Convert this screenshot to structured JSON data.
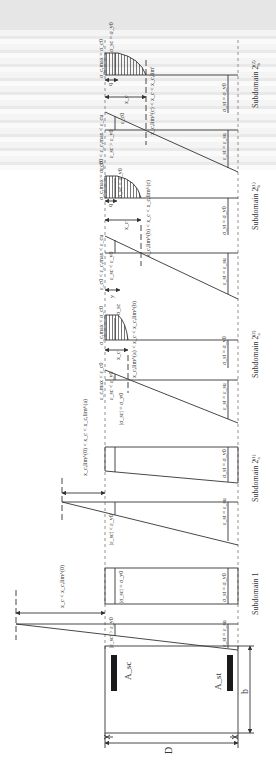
{
  "figure": {
    "orientation": "rotated-90-ccw",
    "subdomains": [
      {
        "id": "sub1",
        "title": "Subdomain 1",
        "strain_condition": "|ε_sc| > ε_y0",
        "strain_tension": "ε_st = ε_su",
        "stress_compression": "|σ_sc| = σ_y0",
        "stress_tension": "σ_st = σ_y0",
        "neutral_axis": "x_c < x_c,lim^(0)"
      },
      {
        "id": "sub2a1",
        "title": "Subdomain 2a(1)",
        "title_main": "Subdomain 2",
        "title_sub": "a",
        "title_sup": "(1)",
        "strain_condition": "|ε_sc| < ε_y0",
        "strain_tension": "ε_st = ε_su",
        "stress_compression": "|σ_sc| = σ_y0",
        "stress_tension": "σ_st = σ_y0",
        "neutral_axis": "x_c,lim^(0) < x_c < x_c,lim^(a)"
      },
      {
        "id": "sub2a2",
        "title": "Subdomain 2a(2)",
        "title_main": "Subdomain 2",
        "title_sub": "a",
        "title_sup": "(2)",
        "strain_top": "ε_c,max < ε_c0",
        "strain_condition": "ε_sc < ε_y0",
        "strain_tension": "ε_st = ε_su",
        "stress_top": "σ_c,max < σ_c0",
        "stress_compression": "σ_sc",
        "stress_tension": "σ_st = σ_y0",
        "depth": "x_c",
        "neutral_axis": "x_c,lim^(a) < x_c < x_c,lim^(b)"
      },
      {
        "id": "sub2b1",
        "title": "Subdomain 2b(1)",
        "title_main": "Subdomain 2",
        "title_sub": "b",
        "title_sup": "(1)",
        "strain_top": "ε_c0 < ε_c,max < ε_cu",
        "strain_condition": "ε_sc < ε_y0",
        "strain_tension": "ε_st = ε_su",
        "stress_top": "σ_c,max = σ_c0",
        "stress_compression": "σ_sc < σ_y0",
        "stress_tension": "σ_st = σ_y0",
        "depth": "x_c",
        "plateau": "q",
        "bar_offset": "y",
        "neutral_axis": "x_c,lim^(b) < x_c < x_c,lim^(c)"
      },
      {
        "id": "sub2b2",
        "title": "Subdomain 2b(2)",
        "title_main": "Subdomain 2",
        "title_sub": "b",
        "title_sup": "(2)",
        "strain_top": "ε_c0 < ε_c,max < ε_cu",
        "strain_condition": "ε_sc > ε_y0",
        "strain_mid": "ε_c0",
        "strain_tension": "ε_st = ε_su",
        "stress_top": "σ_c,max = σ_c0",
        "stress_compression": "σ_sc = σ_y0",
        "stress_tension": "σ_st = σ_y0",
        "depth": "x_c",
        "plateau": "q",
        "neutral_axis": "x_c,lim^(c) < x_c < x_c,lim'"
      }
    ],
    "section": {
      "compression_steel": "A_sc",
      "tension_steel": "A_st",
      "width": "b",
      "depth": "D"
    },
    "colors": {
      "line": "#333333",
      "fill_bar": "#1a1a1a",
      "hatch": "#555555",
      "dash": "#777777"
    }
  }
}
